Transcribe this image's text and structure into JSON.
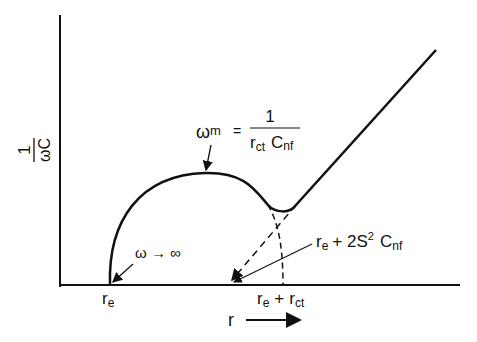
{
  "diagram": {
    "y_axis": {
      "label_num": "1",
      "label_den": "ωC"
    },
    "x_axis": {
      "label": "r",
      "arrow": "→"
    },
    "annotations": {
      "omega_m": {
        "lhs": "ω",
        "lhs_sub": "m",
        "eq": "=",
        "num": "1",
        "den_r": "r",
        "den_r_sub": "ct",
        "den_c": "C",
        "den_c_sub": "nf"
      },
      "omega_inf": {
        "text": "ω → ∞"
      },
      "intercept": {
        "r": "r",
        "r_sub": "e",
        "plus": "+ 2S",
        "sup": "2",
        "c": "C",
        "c_sub": "nf"
      },
      "tick_re": {
        "r": "r",
        "sub": "e"
      },
      "tick_re_rct": {
        "r": "r",
        "sub": "e",
        "plus": "+",
        "r2": "r",
        "sub2": "ct"
      }
    },
    "colors": {
      "line": "#111111",
      "background": "#ffffff"
    }
  }
}
